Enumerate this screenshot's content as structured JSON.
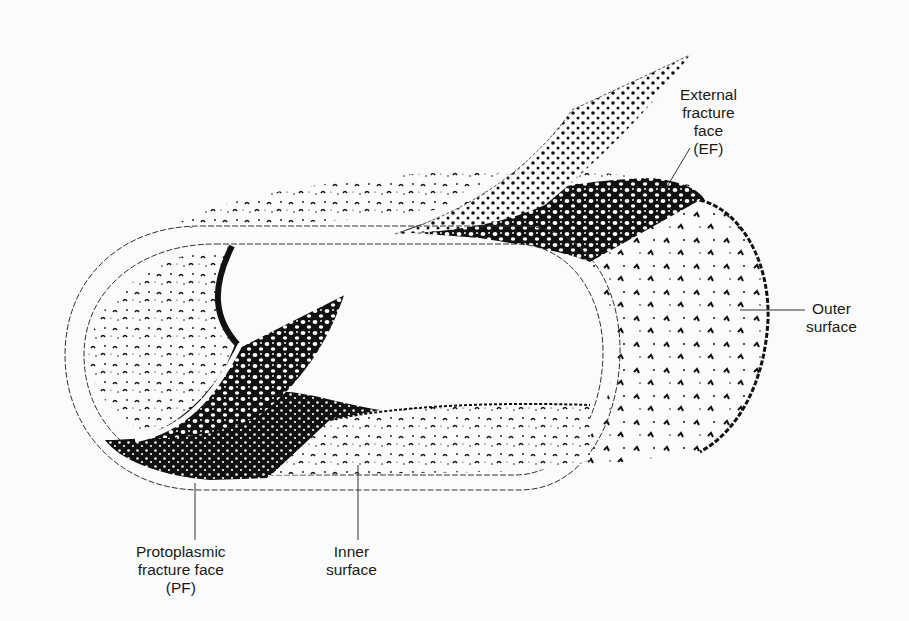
{
  "diagram": {
    "colors": {
      "ink": "#111111",
      "paper": "#fbfbfb",
      "label_text": "#1a1a1a"
    },
    "labels": {
      "ef": {
        "lines": [
          "External",
          "fracture",
          "face",
          "(EF)"
        ]
      },
      "outer": {
        "lines": [
          "Outer",
          "surface"
        ]
      },
      "pf": {
        "lines": [
          "Protoplasmic",
          "fracture face",
          "(PF)"
        ]
      },
      "inner": {
        "lines": [
          "Inner",
          "surface"
        ]
      }
    }
  }
}
